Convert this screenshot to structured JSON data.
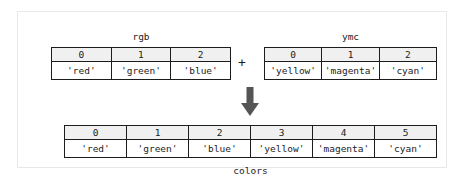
{
  "figure": {
    "operator": "+",
    "arrow_icon": "down-arrow-icon",
    "colors": {
      "border": "#1c1c1c",
      "header_fill": "#f0f0f0",
      "frame": "#e8e8e8",
      "text": "#1c1c1c"
    }
  },
  "arrays": {
    "rgb": {
      "label": "rgb",
      "indices": [
        "0",
        "1",
        "2"
      ],
      "values": [
        "'red'",
        "'green'",
        "'blue'"
      ]
    },
    "ymc": {
      "label": "ymc",
      "indices": [
        "0",
        "1",
        "2"
      ],
      "values": [
        "'yellow'",
        "'magenta'",
        "'cyan'"
      ]
    },
    "colors": {
      "label": "colors",
      "indices": [
        "0",
        "1",
        "2",
        "3",
        "4",
        "5"
      ],
      "values": [
        "'red'",
        "'green'",
        "'blue'",
        "'yellow'",
        "'magenta'",
        "'cyan'"
      ]
    }
  }
}
